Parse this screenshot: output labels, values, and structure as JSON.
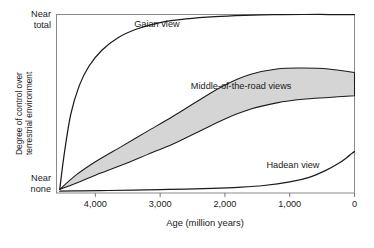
{
  "chart_data": {
    "type": "line",
    "title": "",
    "xlabel": "Age (million years)",
    "ylabel": "Degree of control over terrestrial environment",
    "ylabel_line1": "Degree of control over",
    "ylabel_line2": "terrestrial environment",
    "x_ticks": [
      "4,000",
      "3,000",
      "2,000",
      "1,000",
      "0"
    ],
    "x_tick_values": [
      4000,
      3000,
      2000,
      1000,
      0
    ],
    "xlim": [
      4600,
      0
    ],
    "x_axis_direction": "decreasing",
    "y_ticks": [
      "Near total",
      "Near none"
    ],
    "y_tick_top_line1": "Near",
    "y_tick_top_line2": "total",
    "y_tick_bottom_line1": "Near",
    "y_tick_bottom_line2": "none",
    "ylim": [
      0,
      1
    ],
    "grid": false,
    "legend": "inline-annotations",
    "fill_color": "#d5d5d5",
    "line_color": "#1a1a1a",
    "frame_color": "#7f7f7f",
    "annotations": [
      {
        "text": "Gaian view",
        "x": 3050,
        "y": 0.93
      },
      {
        "text": "Middle-of-the-road views",
        "x": 1750,
        "y": 0.58
      },
      {
        "text": "Hadean view",
        "x": 950,
        "y": 0.14
      }
    ],
    "series": [
      {
        "name": "Gaian view",
        "kind": "line",
        "x": [
          4550,
          4480,
          4380,
          4250,
          4100,
          3900,
          3650,
          3350,
          3000,
          2600,
          2150,
          1700,
          1250,
          800,
          400,
          0
        ],
        "y": [
          0.02,
          0.22,
          0.44,
          0.6,
          0.71,
          0.8,
          0.87,
          0.92,
          0.955,
          0.975,
          0.988,
          0.995,
          0.999,
          1.0,
          1.0,
          1.0
        ]
      },
      {
        "name": "Middle-of-the-road views upper bound",
        "kind": "band-upper",
        "x": [
          4550,
          4300,
          4000,
          3600,
          3200,
          2800,
          2400,
          2000,
          1600,
          1200,
          800,
          400,
          0
        ],
        "y": [
          0.02,
          0.1,
          0.175,
          0.26,
          0.345,
          0.43,
          0.52,
          0.605,
          0.665,
          0.695,
          0.7,
          0.695,
          0.675
        ]
      },
      {
        "name": "Middle-of-the-road views lower bound",
        "kind": "band-lower",
        "x": [
          4550,
          4300,
          4000,
          3600,
          3200,
          2800,
          2400,
          2000,
          1600,
          1200,
          800,
          400,
          0
        ],
        "y": [
          0.02,
          0.055,
          0.1,
          0.155,
          0.215,
          0.275,
          0.345,
          0.415,
          0.47,
          0.505,
          0.525,
          0.535,
          0.545
        ]
      },
      {
        "name": "Hadean view",
        "kind": "line",
        "x": [
          4550,
          4200,
          3800,
          3400,
          3000,
          2600,
          2200,
          1800,
          1400,
          1000,
          700,
          450,
          250,
          120,
          40,
          0
        ],
        "y": [
          0.01,
          0.012,
          0.014,
          0.016,
          0.019,
          0.022,
          0.026,
          0.032,
          0.042,
          0.062,
          0.088,
          0.125,
          0.165,
          0.198,
          0.222,
          0.232
        ]
      }
    ]
  }
}
